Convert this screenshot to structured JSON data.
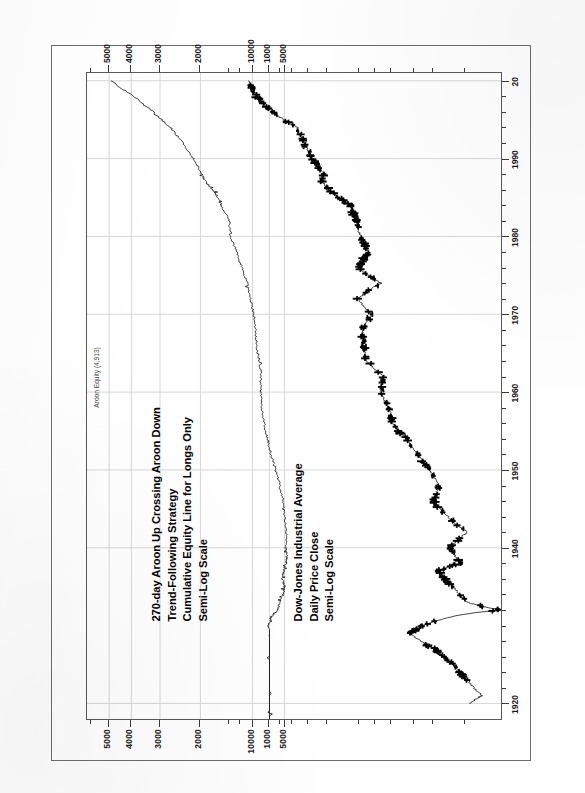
{
  "document": {
    "kind": "scanned-chart-page",
    "orientation": "rotated-90-ccw",
    "page_color": "#ffffff",
    "ink_color": "#000000",
    "grid_color": "#d7d7d7"
  },
  "annotations": {
    "series_tag": "Aroon Equity (4,913)"
  },
  "titles": {
    "upper": [
      "270-day Aroon Up Crossing Aroon Down",
      "Trend-Following Strategy",
      "Cumulative Equity Line for Longs Only",
      "Semi-Log Scale"
    ],
    "lower": [
      "Dow-Jones Industrial Average",
      "Daily Price Close",
      "Semi-Log Scale"
    ]
  },
  "axes": {
    "time": {
      "label": "",
      "tick_labels": [
        "1920",
        "1940",
        "1950",
        "1960",
        "1970",
        "1980",
        "1990",
        "20"
      ],
      "tick_values": [
        1920,
        1940,
        1950,
        1960,
        1970,
        1980,
        1990,
        2000
      ],
      "minor_step": 2,
      "range": [
        1918,
        2001
      ]
    },
    "equity_scale": {
      "label": "",
      "tick_labels": [
        "1000",
        "2000",
        "3000",
        "4000",
        "5000"
      ],
      "tick_values": [
        1000,
        2000,
        3000,
        4000,
        5000
      ],
      "type": "log"
    },
    "dow_scale": {
      "label": "",
      "tick_labels": [
        "5000",
        "10000"
      ],
      "tick_values": [
        5000,
        10000
      ],
      "type": "log"
    }
  },
  "chart_data": {
    "type": "line",
    "title": "270-day Aroon Up Crossing Aroon Down Trend-Following Strategy",
    "subtitle": "Cumulative Equity Line for Longs Only / Dow-Jones Industrial Average Daily Price Close",
    "xlabel": "Year",
    "ylabel": "Value (Semi-Log Scale)",
    "grid": true,
    "legend_position": "inline-annotation",
    "xlim": [
      1918,
      2001
    ],
    "series": [
      {
        "name": "Aroon Equity (4,913)",
        "panel": "upper",
        "ylim": [
          700,
          6000
        ],
        "yticks": [
          1000,
          2000,
          3000,
          4000,
          5000
        ],
        "final_value": 4913,
        "x": [
          1918,
          1921,
          1925,
          1928,
          1929,
          1930,
          1931,
          1932,
          1933,
          1934,
          1935,
          1936,
          1937,
          1938,
          1939,
          1940,
          1942,
          1944,
          1946,
          1948,
          1950,
          1952,
          1954,
          1956,
          1958,
          1960,
          1962,
          1964,
          1966,
          1968,
          1970,
          1972,
          1974,
          1976,
          1978,
          1980,
          1982,
          1984,
          1985,
          1986,
          1987,
          1988,
          1990,
          1992,
          1994,
          1996,
          1998,
          2000
        ],
        "y": [
          1000,
          1000,
          1000,
          1000,
          1000,
          1010,
          990,
          920,
          905,
          870,
          860,
          880,
          870,
          845,
          840,
          850,
          845,
          860,
          880,
          900,
          940,
          985,
          1020,
          1055,
          1080,
          1095,
          1090,
          1105,
          1140,
          1150,
          1170,
          1215,
          1250,
          1320,
          1390,
          1480,
          1500,
          1620,
          1680,
          1760,
          1900,
          1970,
          2140,
          2380,
          2700,
          3200,
          3900,
          4913
        ]
      },
      {
        "name": "Dow-Jones Industrial Average",
        "panel": "lower",
        "ylim": [
          50,
          14000
        ],
        "yticks": [
          5000,
          10000
        ],
        "x": [
          1920,
          1921,
          1923,
          1925,
          1927,
          1929,
          1930,
          1932,
          1933,
          1935,
          1937,
          1938,
          1940,
          1942,
          1944,
          1946,
          1948,
          1950,
          1952,
          1954,
          1956,
          1958,
          1960,
          1962,
          1964,
          1966,
          1968,
          1970,
          1972,
          1974,
          1976,
          1978,
          1980,
          1982,
          1984,
          1986,
          1987,
          1988,
          1990,
          1992,
          1994,
          1996,
          1998,
          2000
        ],
        "y": [
          90,
          70,
          95,
          130,
          190,
          330,
          250,
          45,
          95,
          130,
          180,
          110,
          140,
          95,
          145,
          200,
          175,
          215,
          280,
          350,
          490,
          520,
          620,
          580,
          850,
          900,
          930,
          760,
          1020,
          620,
          1000,
          820,
          960,
          1050,
          1200,
          1900,
          2200,
          2150,
          2700,
          3300,
          3800,
          6400,
          9200,
          11000
        ]
      }
    ]
  }
}
